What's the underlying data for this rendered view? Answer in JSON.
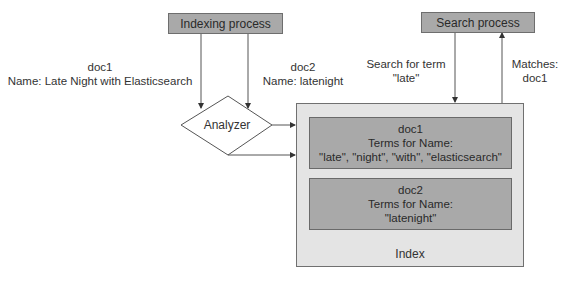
{
  "diagram": {
    "indexing_process": {
      "label": "Indexing process"
    },
    "search_process": {
      "label": "Search process"
    },
    "doc1_input": {
      "line1": "doc1",
      "line2": "Name: Late Night with Elasticsearch"
    },
    "doc2_input": {
      "line1": "doc2",
      "line2": "Name: latenight"
    },
    "search_query": {
      "line1": "Search for term",
      "line2": "\"late\""
    },
    "matches": {
      "line1": "Matches:",
      "line2": "doc1"
    },
    "analyzer": {
      "label": "Analyzer"
    },
    "index": {
      "label": "Index",
      "docs": [
        {
          "title": "doc1",
          "subtitle": "Terms for Name:",
          "terms": "\"late\", \"night\", \"with\", \"elasticsearch\""
        },
        {
          "title": "doc2",
          "subtitle": "Terms for Name:",
          "terms": "\"latenight\""
        }
      ]
    },
    "colors": {
      "process_fill": "#a9a9a9",
      "index_fill": "#e4e4e4",
      "doc_fill": "#a9a9a9",
      "line": "#333333"
    }
  }
}
